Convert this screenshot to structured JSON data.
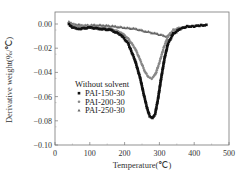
{
  "chart_data": {
    "type": "scatter",
    "title": "",
    "xlabel": "Temperature(℃)",
    "ylabel": "Derivative weight(%/℃)",
    "xlim": [
      0,
      500
    ],
    "ylim": [
      -0.1,
      0.01
    ],
    "xticks": [
      "0",
      "100",
      "200",
      "300",
      "400",
      "500"
    ],
    "yticks": [
      "0.00",
      "-0.02",
      "-0.04",
      "-0.06",
      "-0.08",
      "-0.10"
    ],
    "grid": false,
    "legend": {
      "title": "Without solvent",
      "position": "center-left",
      "entries": [
        "PAI-150-30",
        "PAI-200-30",
        "PAI-250-30"
      ]
    },
    "series": [
      {
        "name": "PAI-150-30",
        "marker": "square",
        "color": "#111111",
        "x": [
          40,
          50,
          70,
          100,
          130,
          160,
          190,
          210,
          230,
          245,
          255,
          265,
          272,
          280,
          288,
          296,
          305,
          315,
          325,
          340,
          360,
          380,
          400,
          420,
          440
        ],
        "y": [
          0.0,
          -0.003,
          -0.004,
          -0.003,
          -0.004,
          -0.005,
          -0.009,
          -0.016,
          -0.03,
          -0.045,
          -0.058,
          -0.07,
          -0.076,
          -0.078,
          -0.074,
          -0.062,
          -0.045,
          -0.028,
          -0.016,
          -0.008,
          -0.004,
          -0.002,
          -0.002,
          -0.001,
          -0.001
        ]
      },
      {
        "name": "PAI-200-30",
        "marker": "circle",
        "color": "#888888",
        "x": [
          40,
          50,
          70,
          100,
          130,
          160,
          190,
          210,
          230,
          245,
          258,
          268,
          278,
          288,
          300,
          312,
          325,
          340,
          360
        ],
        "y": [
          0.001,
          -0.001,
          -0.002,
          -0.002,
          -0.003,
          -0.004,
          -0.007,
          -0.012,
          -0.02,
          -0.03,
          -0.039,
          -0.044,
          -0.045,
          -0.042,
          -0.032,
          -0.02,
          -0.01,
          -0.005,
          -0.003
        ]
      },
      {
        "name": "PAI-250-30",
        "marker": "triangle",
        "color": "#666666",
        "x": [
          40,
          50,
          80,
          110,
          140,
          170,
          200,
          230,
          260,
          290,
          320,
          340,
          360
        ],
        "y": [
          0.002,
          0.0,
          -0.001,
          -0.001,
          -0.001,
          -0.002,
          -0.003,
          -0.004,
          -0.006,
          -0.008,
          -0.01,
          -0.008,
          -0.004
        ]
      }
    ]
  }
}
